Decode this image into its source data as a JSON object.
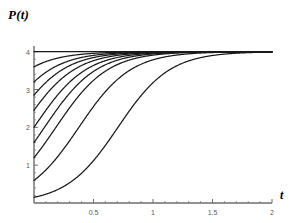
{
  "figure": {
    "background_color": "#ffffff",
    "curve_color": "#1a1a1a",
    "axis_color": "#6e6e6e",
    "tick_label_color": "#5a5a5a"
  },
  "axes": {
    "y_axis_title": "P(t)",
    "x_axis_title": "t",
    "x_ticks": [
      {
        "value": 0.5,
        "label": "0.5"
      },
      {
        "value": 1,
        "label": "1"
      },
      {
        "value": 1.5,
        "label": "1.5"
      },
      {
        "value": 2,
        "label": "2"
      }
    ],
    "y_ticks": [
      {
        "value": 1,
        "label": "1"
      },
      {
        "value": 2,
        "label": "2"
      },
      {
        "value": 3,
        "label": "3"
      },
      {
        "value": 4,
        "label": "4"
      }
    ],
    "x_minor_ticks": [
      0.1,
      0.2,
      0.3,
      0.4,
      0.6,
      0.7,
      0.8,
      0.9,
      1.1,
      1.2,
      1.3,
      1.4,
      1.6,
      1.7,
      1.8,
      1.9
    ],
    "y_minor_ticks": [
      0.2,
      0.4,
      0.6,
      0.8,
      1.2,
      1.4,
      1.6,
      1.8,
      2.2,
      2.4,
      2.6,
      2.8,
      3.2,
      3.4,
      3.6,
      3.8
    ]
  },
  "chart_data": {
    "type": "line",
    "title": "",
    "subtitle": "",
    "xlabel": "t",
    "ylabel": "P(t)",
    "xlim": [
      0,
      2
    ],
    "ylim": [
      0,
      4.15
    ],
    "grid": false,
    "legend": "none",
    "annotations": [],
    "model": {
      "equation": "dP/dt = r*P*(1 - P/K)",
      "carrying_capacity": 4,
      "growth_rate": 4.6,
      "description": "Family of logistic growth solution curves with varying initial conditions P(0), all converging to the carrying capacity P = 4."
    },
    "series": [
      {
        "name": "P(0) = 4.00",
        "initial_value": 4.0
      },
      {
        "name": "P(0) = 3.60",
        "initial_value": 3.6
      },
      {
        "name": "P(0) = 3.20",
        "initial_value": 3.2
      },
      {
        "name": "P(0) = 2.85",
        "initial_value": 2.85
      },
      {
        "name": "P(0) = 2.45",
        "initial_value": 2.45
      },
      {
        "name": "P(0) = 2.00",
        "initial_value": 2.0
      },
      {
        "name": "P(0) = 1.60",
        "initial_value": 1.6
      },
      {
        "name": "P(0) = 1.20",
        "initial_value": 1.2
      },
      {
        "name": "P(0) = 0.60",
        "initial_value": 0.6
      },
      {
        "name": "P(0) = 0.15",
        "initial_value": 0.15
      }
    ]
  }
}
